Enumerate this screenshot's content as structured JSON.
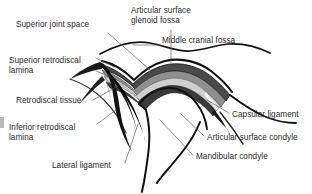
{
  "figure": {
    "background_color": "#ffffff",
    "text_color": "#2b2b2b",
    "width": 312,
    "height": 194
  },
  "labels": [
    {
      "id": "superior-joint-space",
      "text": "Superior joint space",
      "x": 16,
      "y": 20,
      "leader": "line from label to superior joint space above disc"
    },
    {
      "id": "articular-surface-glenoid-fossa",
      "text": "Articular surface\nglenoid fossa",
      "x": 131,
      "y": 6,
      "leader": "vertical line down to glenoid fossa articular surface"
    },
    {
      "id": "middle-cranial-fossa",
      "text": "Middle cranial fossa",
      "x": 162,
      "y": 36,
      "leader": "horizontal line left to cranial base curve"
    },
    {
      "id": "superior-retrodiscal-lamina",
      "text": "Superior retrodiscal\nlamina",
      "x": 9,
      "y": 56,
      "leader": "two lines to superior retrodiscal lamina"
    },
    {
      "id": "retrodiscal-tissue",
      "text": "Retrodiscal tissue",
      "x": 16,
      "y": 96,
      "leader": "line to dark retrodiscal tissue wedge"
    },
    {
      "id": "inferior-retrodiscal-lamina",
      "text": "Inferior retrodiscal\nlamina",
      "x": 9,
      "y": 123,
      "leader": "line to inferior retrodiscal lamina"
    },
    {
      "id": "lateral-ligament",
      "text": "Lateral ligament",
      "x": 52,
      "y": 161,
      "leader": "line up to lateral ligament fiber"
    },
    {
      "id": "capsular-ligament",
      "text": "Capsular ligament",
      "x": 232,
      "y": 110,
      "leader": "line left to capsular ligament"
    },
    {
      "id": "articular-surface-condyle",
      "text": "Articular surface condyle",
      "x": 207,
      "y": 133,
      "leader": "line left to condyle articular surface"
    },
    {
      "id": "mandibular-condyle",
      "text": "Mandibular condyle",
      "x": 196,
      "y": 152,
      "leader": "line left to mandibular condyle body"
    }
  ],
  "structures": [
    {
      "id": "glenoid-fossa",
      "name": "Glenoid fossa",
      "fill": "#ffffff",
      "stroke": "#111111"
    },
    {
      "id": "articular-disc",
      "name": "Articular disc",
      "fill": "#8a8a8a",
      "stroke": "#111111"
    },
    {
      "id": "disc-inner-band",
      "name": "Articular disc inner band",
      "fill": "#d6d6d6"
    },
    {
      "id": "retrodiscal-tissue-wedge",
      "name": "Retrodiscal tissue",
      "fill": "#1a1a1a"
    },
    {
      "id": "mandibular-condyle-body",
      "name": "Mandibular condyle",
      "fill": "#ffffff",
      "stroke": "#111111"
    },
    {
      "id": "capsular-ligament-band",
      "name": "Capsular ligament",
      "fill": "#262626"
    }
  ],
  "colors": {
    "ink": "#111111",
    "disc_gray": "#8a8a8a",
    "disc_light": "#d6d6d6",
    "dark_tissue": "#1a1a1a",
    "leader": "#555555",
    "edge_mark": "#b9b9b9"
  }
}
